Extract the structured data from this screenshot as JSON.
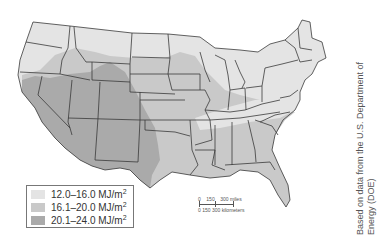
{
  "map": {
    "subject": "Average daily solar radiation, contiguous United States",
    "colors": {
      "low": "#e8e8e8",
      "mid": "#c8c8c8",
      "high": "#a8a8a8",
      "border": "#3a3a3a"
    }
  },
  "legend": {
    "items": [
      {
        "range": "12.0–16.0 MJ/m",
        "sup": "2",
        "level": "low"
      },
      {
        "range": "16.1–20.0 MJ/m",
        "sup": "2",
        "level": "mid"
      },
      {
        "range": "20.1–24.0 MJ/m",
        "sup": "2",
        "level": "high"
      }
    ]
  },
  "scale_bar": {
    "miles_labels": [
      "0",
      "150",
      "300 miles"
    ],
    "km_labels": [
      "0",
      "150",
      "300 kilometers"
    ]
  },
  "credit": {
    "line1": "Based on data from the U.S. Department of",
    "line2": "Energy (DOE)"
  }
}
